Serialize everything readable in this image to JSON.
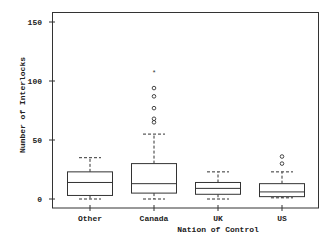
{
  "chart_data": {
    "type": "box",
    "title": "",
    "xlabel": "Nation of Control",
    "ylabel": "Number of Interlocks",
    "ylim": [
      -8,
      160
    ],
    "yticks": [
      0,
      50,
      100,
      150
    ],
    "grid": false,
    "legend": null,
    "categories": [
      "Other",
      "Canada",
      "UK",
      "US"
    ],
    "boxes": [
      {
        "name": "Other",
        "whisker_low": 0,
        "q1": 3,
        "median": 14,
        "q3": 23,
        "whisker_high": 35,
        "outliers": [],
        "extremes": []
      },
      {
        "name": "Canada",
        "whisker_low": 0,
        "q1": 5,
        "median": 13,
        "q3": 30,
        "whisker_high": 55,
        "outliers": [
          65,
          68,
          77,
          87,
          94
        ],
        "extremes": [
          108
        ]
      },
      {
        "name": "UK",
        "whisker_low": 0,
        "q1": 4,
        "median": 9,
        "q3": 14,
        "whisker_high": 23,
        "outliers": [],
        "extremes": []
      },
      {
        "name": "US",
        "whisker_low": 1,
        "q1": 2,
        "median": 6,
        "q3": 13,
        "whisker_high": 23,
        "outliers": [
          30,
          36
        ],
        "extremes": []
      }
    ]
  },
  "labels": {
    "xlabel": "Nation of Control",
    "ylabel": "Number of Interlocks",
    "yticks": [
      "0",
      "50",
      "100",
      "150"
    ],
    "categories": [
      "Other",
      "Canada",
      "UK",
      "US"
    ]
  }
}
